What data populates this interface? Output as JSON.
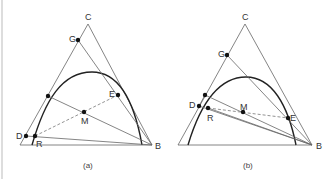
{
  "figure": {
    "panels": [
      {
        "id": "a",
        "caption": "(a)",
        "vertices": {
          "C": "C",
          "B": "B"
        },
        "points": {
          "G": "G",
          "E": "E",
          "M": "M",
          "D": "D",
          "R": "R"
        }
      },
      {
        "id": "b",
        "caption": "(b)",
        "vertices": {
          "C": "C",
          "B": "B"
        },
        "points": {
          "G": "G",
          "E": "E",
          "M": "M",
          "D": "D",
          "R": "R"
        }
      }
    ],
    "colors": {
      "line": "#666666",
      "curve": "#222222",
      "dot": "#111111",
      "dashed": "#777777"
    }
  }
}
